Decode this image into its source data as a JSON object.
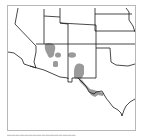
{
  "map": {
    "region": "Southwestern United States",
    "colors": {
      "range_fill": "#9a9a9a",
      "border": "#1a1a1a",
      "frame": "#b8b8b8",
      "background": "#ffffff"
    },
    "range_areas": [
      {
        "name": "range-northern-arizona"
      },
      {
        "name": "range-central-arizona"
      },
      {
        "name": "range-southern-arizona"
      },
      {
        "name": "range-northern-new-mexico"
      },
      {
        "name": "range-southern-new-mexico"
      },
      {
        "name": "range-rio-grande-texas"
      }
    ]
  },
  "caption": {
    "text": "▬▬▬▬▬▬▬▬▬▬▬▬▬▬▬▬"
  }
}
